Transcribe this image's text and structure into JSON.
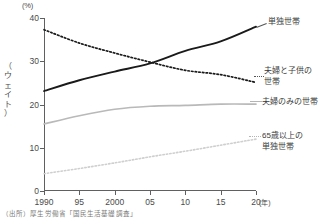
{
  "chart_data": {
    "type": "line",
    "title": "",
    "xlabel": "年",
    "ylabel": "（ウェイト）",
    "y_unit": "(%)",
    "x": [
      1990,
      1995,
      2000,
      2005,
      2010,
      2015,
      2020
    ],
    "xtick_labels": [
      "1990",
      "95",
      "2000",
      "05",
      "10",
      "15",
      "20"
    ],
    "ytick_labels": [
      "0",
      "10",
      "20",
      "30",
      "40"
    ],
    "ytick_values": [
      0,
      10,
      20,
      30,
      40
    ],
    "xlim": [
      1990,
      2020
    ],
    "ylim": [
      0,
      40
    ],
    "grid": false,
    "legend_position": "right-inline-annotations",
    "series": [
      {
        "name": "単独世帯",
        "values": [
          23.1,
          25.6,
          27.6,
          29.5,
          32.4,
          34.6,
          38.0
        ],
        "style": "solid",
        "color": "#1a1a1a",
        "width": 1.9
      },
      {
        "name": "夫婦と子供の世帯",
        "values": [
          37.3,
          34.2,
          31.9,
          29.8,
          27.9,
          26.9,
          25.1
        ],
        "style": "dotted",
        "color": "#1a1a1a",
        "width": 1.7
      },
      {
        "name": "夫婦のみの世帯",
        "values": [
          15.5,
          17.4,
          18.9,
          19.6,
          19.8,
          20.1,
          20.1
        ],
        "style": "solid",
        "color": "#b9b9b9",
        "width": 1.7
      },
      {
        "name": "65歳以上の単独世帯",
        "values": [
          4.0,
          5.2,
          6.5,
          7.9,
          9.2,
          10.6,
          12.0
        ],
        "style": "dotted",
        "color": "#cfcfcf",
        "width": 1.6
      }
    ]
  },
  "axes": {
    "y_unit_label": "(%)",
    "y_title_vertical": "（\nウ\nェ\nイ\nト\n）",
    "x_unit_label": "(年)"
  },
  "annotations": {
    "single": "単独世帯",
    "couple_with_children": "夫婦と子供の\n世帯",
    "couple_only": "夫婦のみの世帯",
    "elderly_single": "65歳以上の\n単独世帯"
  },
  "footer": {
    "source": "（出所）厚生労働省「国民生活基礎調査」"
  }
}
